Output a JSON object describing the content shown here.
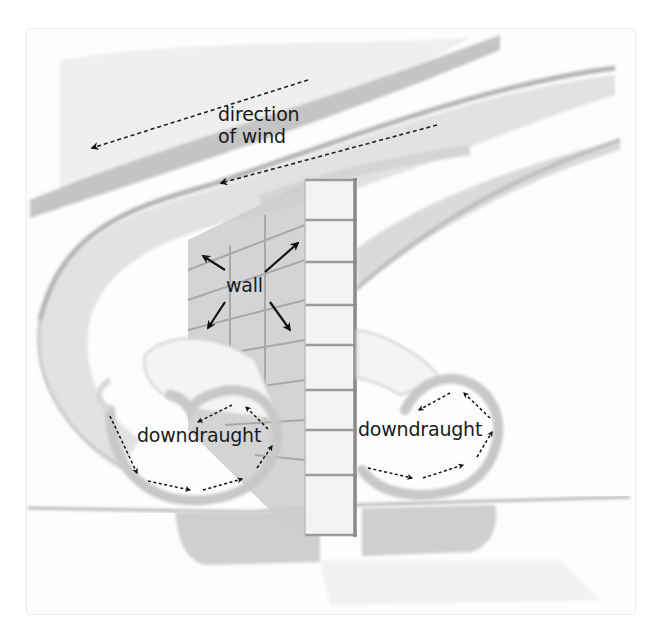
{
  "diagram": {
    "type": "illustration",
    "colors": {
      "background": "#ffffff",
      "wash_light": "#e6e6e6",
      "wash_mid": "#cfcfcf",
      "wash_dark": "#b5b5b5",
      "brick_face": "#f2f2f2",
      "brick_side": "#c9c9c9",
      "mortar": "#9a9a9a",
      "arrow": "#111111",
      "text": "#1a1a1a"
    },
    "labels": {
      "wind_line1": "direction",
      "wind_line2": "of wind",
      "wall": "wall",
      "downdraught_left": "downdraught",
      "downdraught_right": "downdraught"
    },
    "elements": [
      {
        "name": "wind-direction-arrow-upper",
        "style": "dashed",
        "direction": "down-left"
      },
      {
        "name": "wind-direction-arrow-lower",
        "style": "dashed",
        "direction": "down-left"
      },
      {
        "name": "wall-arrows",
        "count": 4,
        "style": "solid",
        "directions": [
          "up-left",
          "up-right",
          "down-left",
          "down-right"
        ]
      },
      {
        "name": "downdraught-left-vortex",
        "arrows": 5,
        "style": "dashed",
        "rotation": "counter-clockwise"
      },
      {
        "name": "downdraught-right-vortex",
        "arrows": 4,
        "style": "dashed",
        "rotation": "counter-clockwise"
      }
    ]
  }
}
